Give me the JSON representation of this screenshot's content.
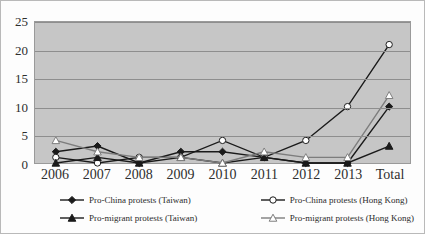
{
  "chart_data": {
    "type": "line",
    "title": "",
    "subtitle": "",
    "xlabel": "",
    "ylabel": "",
    "categories": [
      "2006",
      "2007",
      "2008",
      "2009",
      "2010",
      "2011",
      "2012",
      "2013",
      "Total"
    ],
    "ylim": [
      0,
      25
    ],
    "yticks": [
      0,
      5,
      10,
      15,
      20,
      25
    ],
    "grid": true,
    "legend_position": "bottom",
    "series": [
      {
        "name": "Pro-China protests (Taiwan)",
        "marker": "filled-diamond",
        "line_color": "#1a1a1a",
        "marker_fill": "#1a1a1a",
        "values": [
          2,
          3,
          0,
          2,
          2,
          1,
          0,
          0,
          10
        ]
      },
      {
        "name": "Pro-China protests (Hong Kong)",
        "marker": "open-circle",
        "line_color": "#1a1a1a",
        "marker_fill": "#ffffff",
        "values": [
          1,
          0,
          1,
          1,
          4,
          1,
          4,
          10,
          21
        ]
      },
      {
        "name": "Pro-migrant protests (Taiwan)",
        "marker": "filled-triangle",
        "line_color": "#1a1a1a",
        "marker_fill": "#1a1a1a",
        "values": [
          0,
          1,
          0,
          1,
          0,
          1,
          0,
          0,
          3
        ]
      },
      {
        "name": "Pro-migrant protests (Hong Kong)",
        "marker": "open-triangle",
        "line_color": "#7d7d7d",
        "marker_fill": "#ffffff",
        "values": [
          4,
          2,
          1,
          1,
          0,
          2,
          1,
          1,
          12
        ]
      }
    ]
  },
  "legend": {
    "items": [
      {
        "label": "Pro-China protests (Taiwan)"
      },
      {
        "label": "Pro-China protests (Hong Kong)"
      },
      {
        "label": "Pro-migrant protests (Taiwan)"
      },
      {
        "label": "Pro-migrant protests (Hong Kong)"
      }
    ]
  },
  "colors": {
    "plot_background": "#c6c6c6",
    "gridline": "#8e8e8e",
    "frame": "#b9b9b9",
    "series_dark": "#1a1a1a",
    "series_gray": "#7d7d7d",
    "text": "#2e2e2e"
  }
}
